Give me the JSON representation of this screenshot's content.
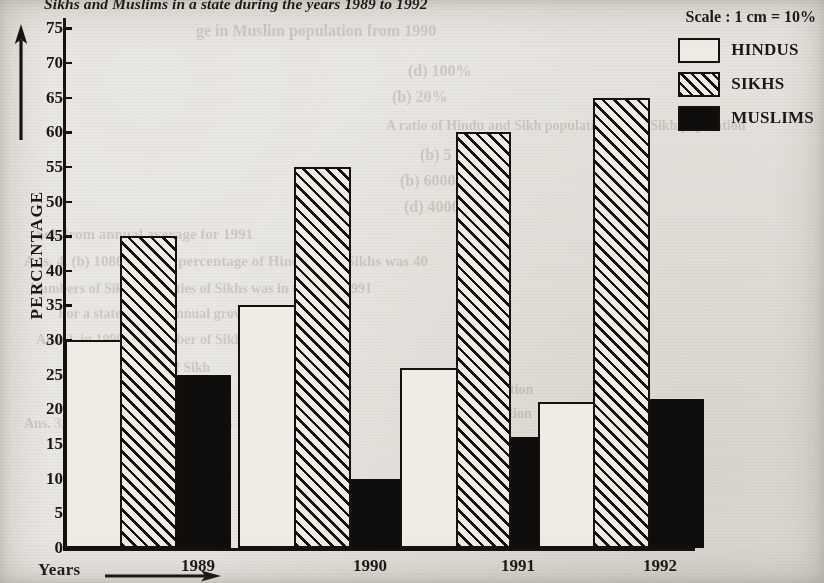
{
  "title": "Sikhs and Muslims in a state during the years 1989 to 1992",
  "scale_note": "Scale : 1 cm = 10%",
  "legend": {
    "items": [
      {
        "label": "HINDUS",
        "pattern": "empty",
        "swatch_name": "legend-swatch-hindus"
      },
      {
        "label": "SIKHS",
        "pattern": "hatched",
        "swatch_name": "legend-swatch-sikhs"
      },
      {
        "label": "MUSLIMS",
        "pattern": "solid-black",
        "swatch_name": "legend-swatch-muslims"
      }
    ]
  },
  "axes": {
    "y_label": "PERCENTAGE",
    "x_label": "Years",
    "y_ticks": [
      0,
      5,
      10,
      15,
      20,
      25,
      30,
      35,
      40,
      45,
      50,
      55,
      60,
      65,
      70,
      75
    ],
    "x_arrow_icon": "right-arrow-icon",
    "y_arrow_icon": "up-arrow-icon"
  },
  "colors": {
    "ink": "#14110e",
    "paper": "#e9e7e2",
    "bar_fill_light": "#efece6",
    "bar_fill_dark": "#100e0c"
  },
  "ghost_text": [
    {
      "text": "ge in Muslim population from 1990",
      "x": 196,
      "y": 22,
      "size": 16,
      "flip": false
    },
    {
      "text": "(d) 100%",
      "x": 408,
      "y": 62,
      "size": 16,
      "flip": false
    },
    {
      "text": "(b) 20%",
      "x": 392,
      "y": 88,
      "size": 16,
      "flip": false
    },
    {
      "text": "A ratio of Hindu and Sikh population in the Sikh population",
      "x": 386,
      "y": 118,
      "size": 14,
      "flip": false
    },
    {
      "text": "(b) 5 : 4",
      "x": 420,
      "y": 146,
      "size": 16,
      "flip": false
    },
    {
      "text": "(b) 6000000",
      "x": 400,
      "y": 172,
      "size": 16,
      "flip": false
    },
    {
      "text": "(d) 400000",
      "x": 404,
      "y": 198,
      "size": 16,
      "flip": false
    },
    {
      "text": "Sol. from annual average for 1991",
      "x": 36,
      "y": 226,
      "size": 15,
      "flip": false
    },
    {
      "text": "Ans. 4. (b) 1080 A.D. 20 percentage of Hindus and Sikhs was 40",
      "x": 24,
      "y": 253,
      "size": 15,
      "flip": false
    },
    {
      "text": "Numbers of Sikhs, the cities of Sikhs was in the year 1991",
      "x": 30,
      "y": 281,
      "size": 14,
      "flip": false
    },
    {
      "text": "For a state during annual growth",
      "x": 58,
      "y": 306,
      "size": 14,
      "flip": false
    },
    {
      "text": "Ans. 2. in 1990 the number of Sikhs and Hindus",
      "x": 36,
      "y": 332,
      "size": 14,
      "flip": false
    },
    {
      "text": "Annual average of Sikh",
      "x": 70,
      "y": 360,
      "size": 14,
      "flip": false
    },
    {
      "text": "Ans. 3. (b) 1991 Sikhs + 25% Sikhs = 10%",
      "x": 24,
      "y": 416,
      "size": 14,
      "flip": false
    },
    {
      "text": "Sikh population",
      "x": 438,
      "y": 382,
      "size": 14,
      "flip": false
    },
    {
      "text": "in population",
      "x": 452,
      "y": 406,
      "size": 14,
      "flip": false
    },
    {
      "text": "5 percent",
      "x": 520,
      "y": 470,
      "size": 14,
      "flip": false
    },
    {
      "text": "state during",
      "x": 500,
      "y": 496,
      "size": 14,
      "flip": false
    }
  ],
  "chart_data": {
    "type": "bar",
    "title": "Sikhs and Muslims in a state during the years 1989 to 1992",
    "xlabel": "Years",
    "ylabel": "PERCENTAGE",
    "ylim": [
      0,
      77
    ],
    "ytick_step": 5,
    "grid": false,
    "legend_position": "top-right",
    "categories": [
      "1989",
      "1990",
      "1991",
      "1992"
    ],
    "series": [
      {
        "name": "HINDUS",
        "values": [
          30,
          35,
          26,
          21
        ]
      },
      {
        "name": "SIKHS",
        "values": [
          45,
          55,
          60,
          65
        ]
      },
      {
        "name": "MUSLIMS",
        "values": [
          25,
          10,
          16,
          21.5
        ]
      }
    ]
  }
}
